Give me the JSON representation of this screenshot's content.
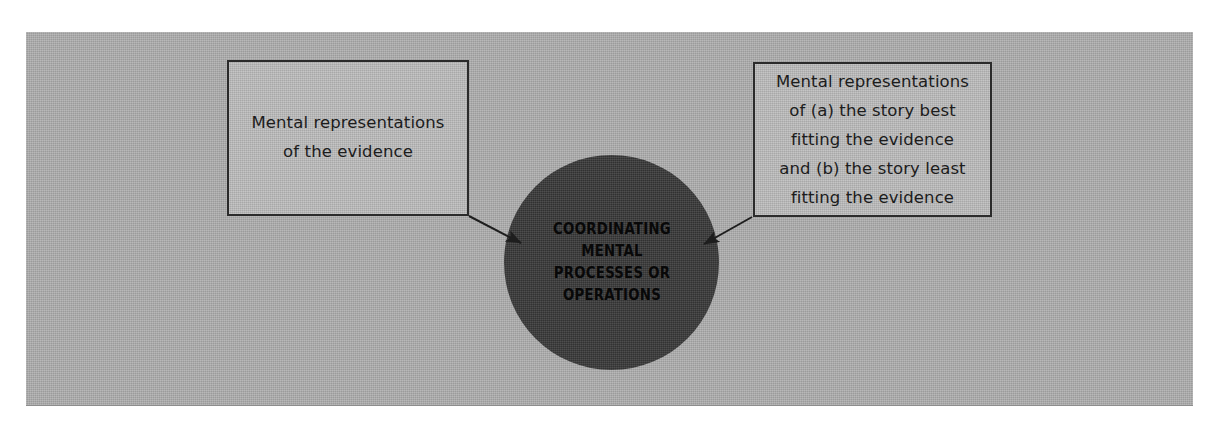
{
  "figure": {
    "background_color": "#ffffff",
    "panel_color": "#a9a9a9",
    "box_fill_color": "#b4b4b4",
    "box_border_color": "#2b2b2b",
    "circle_fill_color": "#3d3d3d",
    "text_color": "#1c1c1c",
    "circle_text_color": "#080808",
    "arrow_color": "#1e1e1e"
  },
  "nodes": {
    "left_box": {
      "name": "Mental representations of the evidence",
      "text": "Mental representations\nof the evidence",
      "lines": [
        "Mental representations",
        "of the evidence"
      ]
    },
    "right_box": {
      "name": "Mental representations of stories",
      "text": "Mental representations\nof (a) the story best\nfitting the evidence\nand (b) the story least\nfitting the evidence",
      "lines": [
        "Mental representations",
        "of (a) the story best",
        "fitting the evidence",
        "and (b) the story least",
        "fitting the evidence"
      ]
    },
    "center_circle": {
      "name": "Coordinating mental processes or operations",
      "text": "COORDINATING\nMENTAL\nPROCESSES OR\nOPERATIONS",
      "lines": [
        "COORDINATING",
        "MENTAL",
        "PROCESSES OR",
        "OPERATIONS"
      ]
    }
  },
  "connectors": [
    {
      "name": "arrow-left-box-to-circle",
      "from": "left_box",
      "to": "center_circle",
      "direction": "right-down",
      "style": "solid-line-with-filled-arrowhead"
    },
    {
      "name": "arrow-right-box-to-circle",
      "from": "right_box",
      "to": "center_circle",
      "direction": "left-down",
      "style": "solid-line-with-filled-arrowhead"
    }
  ]
}
